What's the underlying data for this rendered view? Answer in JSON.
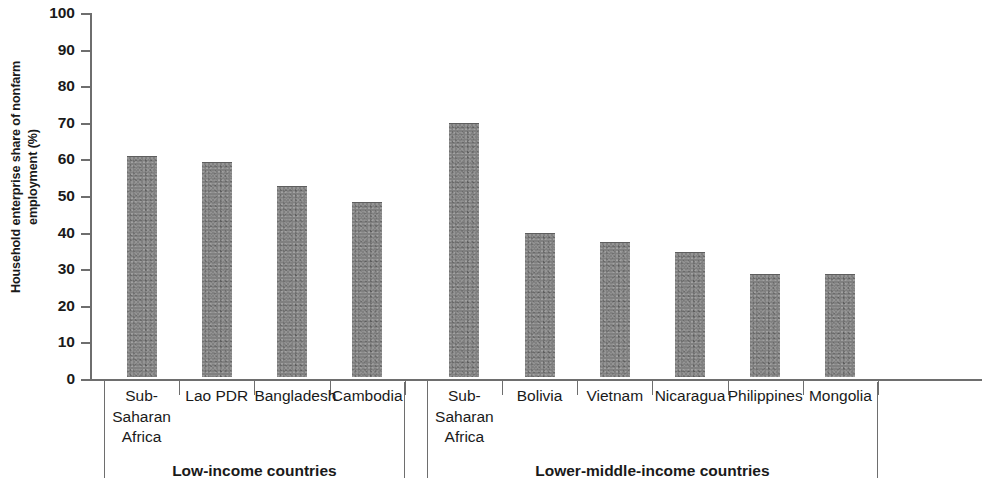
{
  "chart_data": {
    "type": "bar",
    "title": "",
    "xlabel": "",
    "ylabel": "Household enterprise share of nonfarm employment (%)",
    "ylabel_lines": [
      "Household enterprise share of nonfarm",
      "employment (%)"
    ],
    "ylim": [
      0,
      100
    ],
    "ytick_step": 10,
    "ytick_labels": [
      "100",
      "90",
      "80",
      "70",
      "60",
      "50",
      "40",
      "30",
      "20",
      "10",
      "0"
    ],
    "ytick_values": [
      100,
      90,
      80,
      70,
      60,
      50,
      40,
      30,
      20,
      10,
      0
    ],
    "grid": false,
    "legend": "none",
    "bar_color": "#808080",
    "axis_color": "#6e6e6e",
    "categories": [
      "Sub-Saharan Africa",
      "Lao PDR",
      "Bangladesh",
      "Cambodia",
      "Sub-Saharan Africa",
      "Bolivia",
      "Vietnam",
      "Nicaragua",
      "Philippines",
      "Mongolia"
    ],
    "values": [
      60,
      58.5,
      52,
      47.5,
      69,
      39,
      36.5,
      34,
      28,
      28
    ],
    "groups": [
      {
        "name": "Low-income countries",
        "categories": [
          {
            "label_lines": [
              "Sub-",
              "Saharan",
              "Africa"
            ],
            "label": "Sub-Saharan Africa",
            "value": 60
          },
          {
            "label_lines": [
              "Lao PDR"
            ],
            "label": "Lao PDR",
            "value": 58.5
          },
          {
            "label_lines": [
              "Bangladesh"
            ],
            "label": "Bangladesh",
            "value": 52
          },
          {
            "label_lines": [
              "Cambodia"
            ],
            "label": "Cambodia",
            "value": 47.5
          }
        ]
      },
      {
        "name": "Lower-middle-income countries",
        "categories": [
          {
            "label_lines": [
              "Sub-",
              "Saharan",
              "Africa"
            ],
            "label": "Sub-Saharan Africa",
            "value": 69
          },
          {
            "label_lines": [
              "Bolivia"
            ],
            "label": "Bolivia",
            "value": 39
          },
          {
            "label_lines": [
              "Vietnam"
            ],
            "label": "Vietnam",
            "value": 36.5
          },
          {
            "label_lines": [
              "Nicaragua"
            ],
            "label": "Nicaragua",
            "value": 34
          },
          {
            "label_lines": [
              "Philippines"
            ],
            "label": "Philippines",
            "value": 28
          },
          {
            "label_lines": [
              "Mongolia"
            ],
            "label": "Mongolia",
            "value": 28
          }
        ]
      }
    ]
  }
}
